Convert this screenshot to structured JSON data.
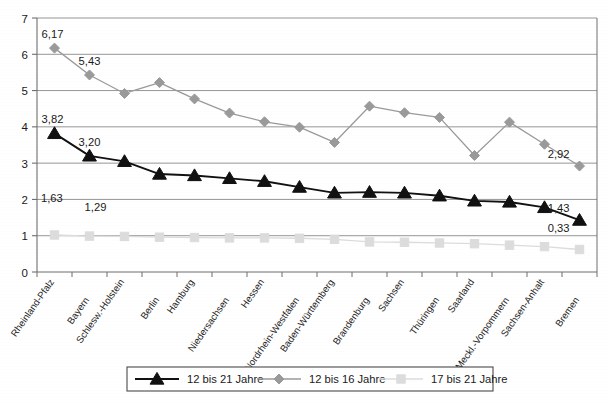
{
  "chart_data": {
    "type": "line",
    "title": "",
    "xlabel": "",
    "ylabel": "",
    "ylim": [
      0,
      7
    ],
    "yticks": [
      "0",
      "1",
      "2",
      "3",
      "4",
      "5",
      "6",
      "7"
    ],
    "grid": true,
    "legend_position": "bottom",
    "categories": [
      "Rheinland-Pfalz",
      "Bayern",
      "Schlesw.-Holstein",
      "Berlin",
      "Hamburg",
      "Niedersachsen",
      "Hessen",
      "Nordrhein-Westfalen",
      "Baden-Württemberg",
      "Brandenburg",
      "Sachsen",
      "Thüringen",
      "Saarland",
      "Meckl.-Vorpommern",
      "Sachsen-Anhalt",
      "Bremen"
    ],
    "series": [
      {
        "name": "12 bis 21 Jahre",
        "color": "#111111",
        "marker": "triangle",
        "values": [
          3.82,
          3.2,
          3.05,
          2.7,
          2.66,
          2.58,
          2.5,
          2.34,
          2.18,
          2.2,
          2.18,
          2.1,
          1.96,
          1.93,
          1.78,
          1.43
        ],
        "labels": [
          {
            "index": 0,
            "text": "3,82"
          },
          {
            "index": 1,
            "text": "3,20"
          },
          {
            "index": 15,
            "text": "1,43"
          }
        ]
      },
      {
        "name": "12 bis 16 Jahre",
        "color": "#9a9a9a",
        "marker": "diamond",
        "values": [
          6.17,
          5.43,
          4.92,
          5.22,
          4.77,
          4.38,
          4.14,
          3.99,
          3.57,
          4.57,
          4.39,
          4.26,
          3.21,
          4.13,
          3.52,
          2.92
        ],
        "labels": [
          {
            "index": 0,
            "text": "6,17"
          },
          {
            "index": 1,
            "text": "5,43"
          },
          {
            "index": 15,
            "text": "2,92"
          }
        ]
      },
      {
        "name": "17 bis 21 Jahre",
        "color": "#dcdcdc",
        "marker": "square",
        "values": [
          1.02,
          0.99,
          0.98,
          0.96,
          0.95,
          0.94,
          0.94,
          0.93,
          0.9,
          0.83,
          0.82,
          0.8,
          0.78,
          0.74,
          0.7,
          0.62
        ],
        "labels": [
          {
            "index": 0,
            "text": "1,63"
          },
          {
            "index": 1,
            "text": "1,29"
          },
          {
            "index": 15,
            "text": "0,33"
          }
        ]
      }
    ]
  },
  "legend": {
    "items": [
      {
        "label": "12 bis 21 Jahre",
        "color": "#111111",
        "marker": "triangle"
      },
      {
        "label": "12 bis 16 Jahre",
        "color": "#9a9a9a",
        "marker": "diamond"
      },
      {
        "label": "17 bis 21 Jahre",
        "color": "#dcdcdc",
        "marker": "square"
      }
    ]
  },
  "colors": {
    "axis": "#6f6f6f",
    "grid": "#8a8a8a",
    "background": "#ffffff",
    "text": "#1a1a1a"
  }
}
